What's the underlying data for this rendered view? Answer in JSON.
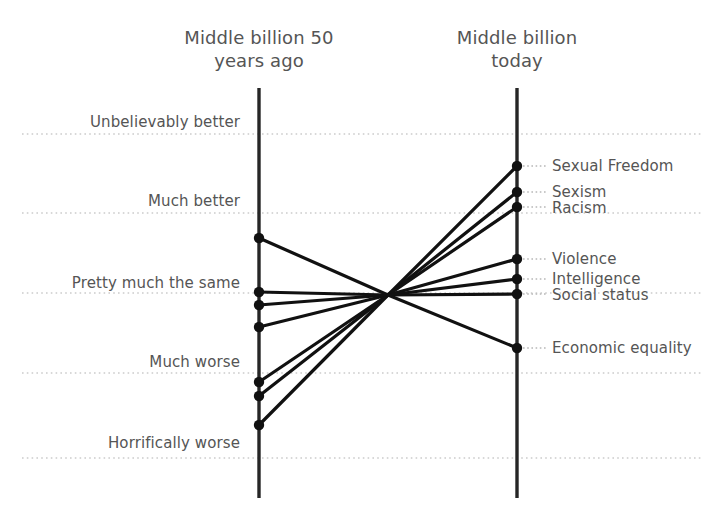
{
  "header": {
    "left_title": "Middle billion 50\nyears ago",
    "right_title": "Middle billion\ntoday"
  },
  "chart_data": {
    "type": "line",
    "title": "",
    "subtitle": "",
    "xlabel": "",
    "ylabel": "",
    "grid": true,
    "legend_position": "none",
    "axis_color": "#262626",
    "line_color": "#111111",
    "dot_color": "#111111",
    "grid_color": "#cccccc",
    "text_color": "#555555",
    "x_categories": [
      "Middle billion 50 years ago",
      "Middle billion today"
    ],
    "y_scale_labels": [
      "Unbelievably better",
      "Much better",
      "Pretty much the same",
      "Much worse",
      "Horrifically worse"
    ],
    "y_scale_values": [
      2,
      1,
      0,
      -1,
      -2
    ],
    "series": [
      {
        "name": "Sexual Freedom",
        "values": [
          -1.62,
          1.58
        ]
      },
      {
        "name": "Sexism",
        "values": [
          -1.28,
          1.27
        ]
      },
      {
        "name": "Racism",
        "values": [
          -1.11,
          1.07
        ]
      },
      {
        "name": "Violence",
        "values": [
          -0.42,
          0.43
        ]
      },
      {
        "name": "Intelligence",
        "values": [
          -0.15,
          0.18
        ]
      },
      {
        "name": "Social status",
        "values": [
          0.01,
          0.01
        ]
      },
      {
        "name": "Economic equality",
        "values": [
          0.68,
          -0.66
        ]
      }
    ],
    "annotations": [
      "Lines cross at a single central convergence point",
      "Right-hand labels connected to endpoints by dotted leaders"
    ]
  },
  "geometry": {
    "left_axis_x": 259,
    "right_axis_x": 517,
    "axis_top_y": 88,
    "axis_bottom_y": 498,
    "grid_x_start": 22,
    "grid_x_end": 702,
    "grid_rows": [
      {
        "label": "Unbelievably better",
        "y": 134,
        "label_y": 113,
        "label_right": 240
      },
      {
        "label": "Much better",
        "y": 213,
        "label_y": 192,
        "label_right": 240
      },
      {
        "label": "Pretty much the same",
        "y": 293,
        "label_y": 274,
        "label_right": 240
      },
      {
        "label": "Much worse",
        "y": 373,
        "label_y": 353,
        "label_right": 240
      },
      {
        "label": "Horrifically worse",
        "y": 458,
        "label_y": 434,
        "label_right": 240
      }
    ],
    "links": [
      {
        "name": "Sexual Freedom",
        "left_y": 425,
        "right_y": 166,
        "label_y": 157,
        "label_x": 552
      },
      {
        "name": "Sexism",
        "left_y": 396,
        "right_y": 192,
        "label_y": 183,
        "label_x": 552
      },
      {
        "name": "Racism",
        "left_y": 382,
        "right_y": 207,
        "label_y": 199,
        "label_x": 552
      },
      {
        "name": "Violence",
        "left_y": 327,
        "right_y": 259,
        "label_y": 250,
        "label_x": 552
      },
      {
        "name": "Intelligence",
        "left_y": 305,
        "right_y": 279,
        "label_y": 270,
        "label_x": 552
      },
      {
        "name": "Social status",
        "left_y": 292,
        "right_y": 294,
        "label_y": 286,
        "label_x": 552
      },
      {
        "name": "Economic equality",
        "left_y": 238,
        "right_y": 348,
        "label_y": 339,
        "label_x": 552
      }
    ],
    "crossing_point": {
      "x": 388,
      "y": 295
    }
  }
}
